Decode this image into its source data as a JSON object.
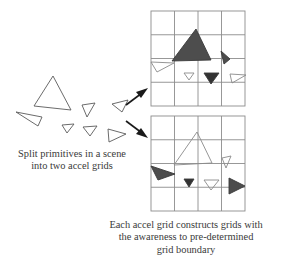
{
  "figure": {
    "background_color": "#ffffff",
    "line_color": "#808080",
    "outline_color": "#555555",
    "dark_fill": "#4a4a4a",
    "mid_fill": "#5a5a5a",
    "text_color": "#3a3a3a"
  },
  "captions": {
    "left": {
      "line1": "Split primitives in a scene",
      "line2": "into two accel grids"
    },
    "right": {
      "line1": "Each accel grid constructs grids with",
      "line2": "the awareness to pre-determined",
      "line3": "grid boundary"
    }
  },
  "scene": {
    "label": "input scene primitives",
    "triangle_count": 7,
    "triangles": [
      {
        "name": "scene-triangle-large",
        "fill": "none",
        "points": "53,76 71,110 34,106"
      },
      {
        "name": "scene-triangle-left-thin",
        "fill": "none",
        "points": "16,112 42,117 38,126"
      },
      {
        "name": "scene-triangle-small-mid",
        "fill": "none",
        "points": "62,125 74,124 67,133"
      },
      {
        "name": "scene-triangle-small-right",
        "fill": "none",
        "points": "82,105 95,103 87,117"
      },
      {
        "name": "scene-triangle-small-lower",
        "fill": "none",
        "points": "83,127 97,126 90,136"
      },
      {
        "name": "scene-triangle-right-open",
        "fill": "none",
        "points": "108,129 126,134 109,142"
      },
      {
        "name": "scene-triangle-far-right",
        "fill": "none",
        "points": "112,104 128,100 122,112"
      }
    ]
  },
  "arrows": {
    "top": {
      "name": "arrow-to-top-grid",
      "from": [
        124,
        104
      ],
      "to": [
        147,
        88
      ]
    },
    "bottom": {
      "name": "arrow-to-bottom-grid",
      "from": [
        124,
        122
      ],
      "to": [
        147,
        137
      ]
    }
  },
  "grids": [
    {
      "name": "top-accel-grid",
      "label": "accel grid A",
      "x": 151,
      "y": 11,
      "width": 94,
      "height": 95,
      "cols": 4,
      "rows": 4,
      "triangles": [
        {
          "name": "grid1-triangle-big-dark",
          "fill": "#4d4d4d",
          "points": "196,29 211,60 172,61"
        },
        {
          "name": "grid1-triangle-small-dark-right",
          "fill": "#4d4d4d",
          "points": "221,51 230,59 224,64"
        },
        {
          "name": "grid1-triangle-open-left",
          "fill": "none",
          "points": "151,62 174,63 157,72"
        },
        {
          "name": "grid1-triangle-open-tiny",
          "fill": "none",
          "points": "184,73 194,73 189,80"
        },
        {
          "name": "grid1-triangle-dark-down",
          "fill": "#333333",
          "points": "204,73 219,73 211,84"
        },
        {
          "name": "grid1-triangle-open-right",
          "fill": "none",
          "points": "230,74 246,75 232,83"
        }
      ]
    },
    {
      "name": "bottom-accel-grid",
      "label": "accel grid B",
      "x": 151,
      "y": 116,
      "width": 94,
      "height": 95,
      "cols": 4,
      "rows": 4,
      "triangles": [
        {
          "name": "grid2-triangle-open-large",
          "fill": "none",
          "points": "197,132 212,163 174,165"
        },
        {
          "name": "grid2-triangle-open-small-right",
          "fill": "none",
          "points": "222,158 231,156 226,168"
        },
        {
          "name": "grid2-triangle-dark-left",
          "fill": "#4d4d4d",
          "points": "151,166 175,174 158,180"
        },
        {
          "name": "grid2-triangle-dark-tiny",
          "fill": "#333333",
          "points": "184,179 194,179 189,187"
        },
        {
          "name": "grid2-triangle-open-down",
          "fill": "none",
          "points": "204,180 219,180 211,190"
        },
        {
          "name": "grid2-triangle-dark-right",
          "fill": "#4d4d4d",
          "points": "229,178 245,186 229,194"
        }
      ]
    }
  ]
}
